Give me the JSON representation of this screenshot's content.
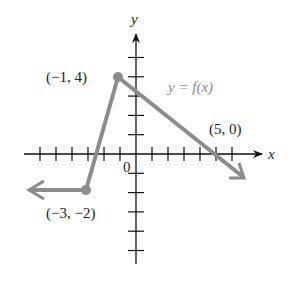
{
  "chart_data": {
    "type": "line",
    "title": "",
    "function_label": "y = f(x)",
    "xlabel": "x",
    "ylabel": "y",
    "origin_label": "0",
    "series": [
      {
        "name": "y = f(x)",
        "color": "#8c8c8c",
        "points": [
          {
            "x": -6,
            "y": -2,
            "arrow": true
          },
          {
            "x": -3,
            "y": -2,
            "label": "(−3, −2)",
            "marker": true
          },
          {
            "x": -1,
            "y": 4,
            "label": "(−1, 4)",
            "marker": true
          },
          {
            "x": 5,
            "y": 0,
            "label": "(5, 0)"
          },
          {
            "x": 6.8,
            "y": -1.2,
            "arrow": true
          }
        ]
      }
    ],
    "xlim": [
      -7,
      8
    ],
    "ylim": [
      -5,
      6
    ],
    "x_ticks": [
      -6,
      -5,
      -4,
      -3,
      -2,
      -1,
      1,
      2,
      3,
      4,
      5,
      6
    ],
    "y_ticks": [
      -5,
      -4,
      -3,
      -2,
      -1,
      1,
      2,
      3,
      4,
      5
    ],
    "grid": false,
    "legend": "none"
  },
  "labels": {
    "point_a": "(−1, 4)",
    "point_b": "(5, 0)",
    "point_c": "(−3, −2)",
    "function": "y = f(x)",
    "x_axis": "x",
    "y_axis": "y",
    "origin": "0"
  }
}
